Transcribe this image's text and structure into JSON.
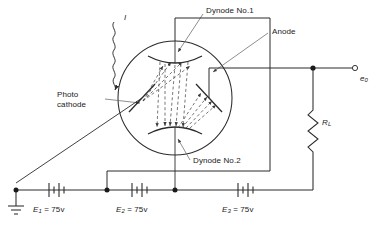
{
  "figure": {
    "type": "circuit-schematic",
    "line_color": "#2b2b2b",
    "dashed_color": "#5a5a5a",
    "background": "#ffffff"
  },
  "labels": {
    "light_input": "I",
    "dynode1": "Dynode No.1",
    "anode": "Anode",
    "photocathode_line1": "Photo",
    "photocathode_line2": "cathode",
    "dynode2": "Dynode No.2",
    "load_resistor": "R",
    "load_resistor_sub": "L",
    "output": "e",
    "output_sub": "0"
  },
  "batteries": [
    {
      "symbol": "E",
      "sub": "1",
      "eq": " = ",
      "value": "75",
      "unit": "v"
    },
    {
      "symbol": "E",
      "sub": "2",
      "eq": " = ",
      "value": "75",
      "unit": "v"
    },
    {
      "symbol": "E",
      "sub": "3",
      "eq": " = ",
      "value": "75",
      "unit": "v"
    }
  ],
  "nodes": {
    "ground": "ground-symbol",
    "junction_count": 4
  }
}
